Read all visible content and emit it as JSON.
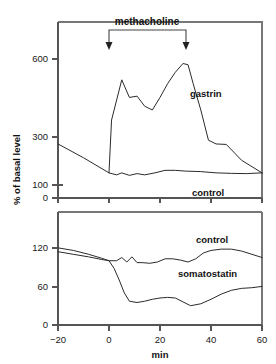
{
  "chart_data": {
    "type": "line",
    "title": "",
    "xlabel": "min",
    "ylabel": "% of basal level",
    "xlim": [
      -20,
      60
    ],
    "xticks": [
      -20,
      0,
      20,
      40,
      60
    ],
    "xticklabels": [
      "–20",
      "0",
      "20",
      "40",
      "60"
    ],
    "grid": false,
    "legend_position": "inline-labels",
    "annotations": [
      {
        "text": "methacholine",
        "type": "bracket-with-arrows",
        "x_start": 0,
        "x_end": 30,
        "panel": "top"
      }
    ],
    "panels": [
      {
        "name": "top",
        "ylabel": "% of basal level",
        "ylim": [
          0,
          700
        ],
        "yticks": [
          0,
          100,
          300,
          600
        ],
        "yticklabels": [
          "0",
          "100",
          "300",
          "600"
        ],
        "series": [
          {
            "name": "gastrin",
            "label": "gastrin",
            "label_x": 36,
            "label_y": 430,
            "x": [
              0,
              1,
              5,
              8,
              11,
              14,
              17,
              20,
              23,
              26,
              29,
              31,
              33,
              36,
              39,
              42,
              46,
              52,
              60
            ],
            "y": [
              100,
              310,
              470,
              400,
              405,
              365,
              350,
              400,
              455,
              500,
              535,
              530,
              455,
              350,
              230,
              215,
              213,
              150,
              100
            ]
          },
          {
            "name": "control",
            "label": "control",
            "label_x": 40,
            "label_y": 55,
            "x": [
              -20,
              -10,
              0,
              3,
              5,
              8,
              11,
              14,
              18,
              22,
              26,
              30,
              36,
              42,
              48,
              54,
              60
            ],
            "y": [
              215,
              160,
              100,
              92,
              100,
              90,
              97,
              92,
              100,
              110,
              110,
              107,
              105,
              100,
              98,
              97,
              100
            ]
          }
        ]
      },
      {
        "name": "bottom",
        "ylabel": "",
        "ylim": [
          0,
          140
        ],
        "yticks": [
          0,
          60,
          120
        ],
        "yticklabels": [
          "0",
          "60",
          "120"
        ],
        "series": [
          {
            "name": "control",
            "label": "control",
            "label_x": 34,
            "label_y": 128,
            "x": [
              -20,
              -14,
              -8,
              -3,
              0,
              3,
              5,
              7,
              9,
              11,
              13,
              16,
              19,
              22,
              25,
              28,
              31,
              34,
              37,
              40,
              44,
              48,
              52,
              56,
              60
            ],
            "y": [
              120,
              116,
              110,
              104,
              100,
              100,
              105,
              98,
              106,
              97,
              97,
              96,
              98,
              103,
              103,
              101,
              98,
              103,
              112,
              116,
              118,
              118,
              115,
              110,
              105
            ]
          },
          {
            "name": "somatostatin",
            "label": "somatostatin",
            "label_x": 28,
            "label_y": 84,
            "x": [
              -20,
              -14,
              -8,
              -3,
              0,
              2,
              4,
              6,
              8,
              11,
              14,
              17,
              20,
              23,
              26,
              29,
              32,
              36,
              40,
              44,
              48,
              52,
              56,
              60
            ],
            "y": [
              114,
              110,
              106,
              102,
              100,
              88,
              70,
              50,
              37,
              35,
              37,
              40,
              42,
              43,
              42,
              36,
              30,
              33,
              40,
              48,
              54,
              57,
              58,
              60
            ]
          }
        ]
      }
    ]
  },
  "labels": {
    "methacholine": "methacholine",
    "gastrin": "gastrin",
    "control_top": "control",
    "control_bottom": "control",
    "somatostatin": "somatostatin",
    "y_axis_title": "% of basal level",
    "x_axis_title": "min",
    "y_top_600": "600",
    "y_top_300": "300",
    "y_top_100": "100",
    "y_top_0": "0",
    "y_bot_120": "120",
    "y_bot_60": "60",
    "y_bot_0": "0",
    "x_m20": "−20",
    "x_0": "0",
    "x_20": "20",
    "x_40": "40",
    "x_60": "60"
  },
  "colors": {
    "curve": "#2b2b2b",
    "axis": "#555555",
    "frame": "#777777",
    "background": "#ffffff"
  }
}
